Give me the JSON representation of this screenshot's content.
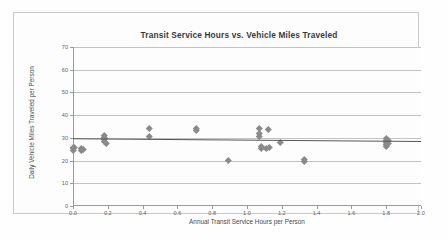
{
  "chart_data": {
    "type": "scatter",
    "title": "Transit Service Hours vs. Vehicle Miles Traveled",
    "xlabel": "Annual Transit Service Hours per Person",
    "ylabel": "Daily Vehicle Miles Traveled per Person",
    "xlim": [
      0.0,
      2.0
    ],
    "ylim": [
      0,
      70
    ],
    "xticks": [
      "0.0",
      "0.2",
      "0.4",
      "0.6",
      "0.8",
      "1.0",
      "1.2",
      "1.4",
      "1.6",
      "1.8",
      "2.0"
    ],
    "xtick_values": [
      0.0,
      0.2,
      0.4,
      0.6,
      0.8,
      1.0,
      1.2,
      1.4,
      1.6,
      1.8,
      2.0
    ],
    "yticks": [
      "0",
      "10",
      "20",
      "30",
      "40",
      "50",
      "60",
      "70"
    ],
    "ytick_values": [
      0,
      10,
      20,
      30,
      40,
      50,
      60,
      70
    ],
    "grid": "horizontal",
    "legend": "none",
    "marker_shape": "diamond",
    "marker_color": "#8a8a8a",
    "trendline_color": "#555555",
    "gridline_color": "#c2c2c2",
    "points": [
      {
        "x": 0.0,
        "y": 26.0
      },
      {
        "x": 0.0,
        "y": 25.2
      },
      {
        "x": 0.0,
        "y": 24.4
      },
      {
        "x": 0.01,
        "y": 25.8
      },
      {
        "x": 0.05,
        "y": 25.4
      },
      {
        "x": 0.05,
        "y": 24.6
      },
      {
        "x": 0.06,
        "y": 25.0
      },
      {
        "x": 0.18,
        "y": 31.0
      },
      {
        "x": 0.18,
        "y": 30.2
      },
      {
        "x": 0.18,
        "y": 29.3
      },
      {
        "x": 0.18,
        "y": 28.4
      },
      {
        "x": 0.19,
        "y": 27.4
      },
      {
        "x": 0.44,
        "y": 34.0
      },
      {
        "x": 0.44,
        "y": 30.5
      },
      {
        "x": 0.71,
        "y": 34.2
      },
      {
        "x": 0.71,
        "y": 33.4
      },
      {
        "x": 0.89,
        "y": 20.3
      },
      {
        "x": 1.07,
        "y": 34.0
      },
      {
        "x": 1.07,
        "y": 32.0
      },
      {
        "x": 1.07,
        "y": 30.6
      },
      {
        "x": 1.08,
        "y": 26.4
      },
      {
        "x": 1.08,
        "y": 25.6
      },
      {
        "x": 1.11,
        "y": 25.4
      },
      {
        "x": 1.12,
        "y": 33.8
      },
      {
        "x": 1.13,
        "y": 26.0
      },
      {
        "x": 1.19,
        "y": 28.2
      },
      {
        "x": 1.33,
        "y": 20.6
      },
      {
        "x": 1.33,
        "y": 19.6
      },
      {
        "x": 1.8,
        "y": 29.6
      },
      {
        "x": 1.8,
        "y": 28.8
      },
      {
        "x": 1.8,
        "y": 28.0
      },
      {
        "x": 1.8,
        "y": 27.2
      },
      {
        "x": 1.8,
        "y": 26.4
      },
      {
        "x": 1.81,
        "y": 29.0
      },
      {
        "x": 1.81,
        "y": 27.6
      }
    ],
    "trendline": {
      "x0": 0.0,
      "y0": 29.6,
      "x1": 2.0,
      "y1": 28.4
    },
    "annotations": [
      {
        "name": "sample-size",
        "text": "n = 35"
      },
      {
        "name": "r-squared",
        "text": "R² = 0.0357"
      }
    ]
  }
}
